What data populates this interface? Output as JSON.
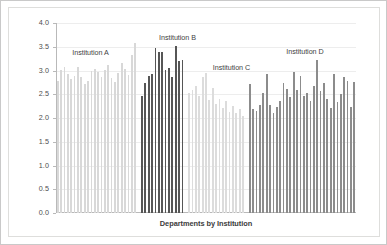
{
  "chart_data": {
    "type": "bar",
    "title": "",
    "xlabel": "Departments by Institution",
    "ylabel": "Mean Instructor-Student Interaction (PIPS)",
    "ylim": [
      0.0,
      4.0
    ],
    "ytick_labels": [
      "0.0",
      "0.5",
      "1.0",
      "1.5",
      "2.0",
      "2.5",
      "3.0",
      "3.5",
      "4.0"
    ],
    "ytick_values": [
      0.0,
      0.5,
      1.0,
      1.5,
      2.0,
      2.5,
      3.0,
      3.5,
      4.0
    ],
    "xtick_labels": [],
    "grid": true,
    "legend": "none",
    "annotations": [
      {
        "text": "Institution A",
        "x_frac": 0.115,
        "y_value": 3.47
      },
      {
        "text": "Institution B",
        "x_frac": 0.405,
        "y_value": 3.78
      },
      {
        "text": "Institution C",
        "x_frac": 0.585,
        "y_value": 3.15
      },
      {
        "text": "Institution D",
        "x_frac": 0.83,
        "y_value": 3.49
      }
    ],
    "series": [
      {
        "name": "Institution A",
        "color": "#d8d8d8",
        "values": [
          2.78,
          3.02,
          3.08,
          2.92,
          2.82,
          2.88,
          3.08,
          2.86,
          2.72,
          2.78,
          2.98,
          3.04,
          2.96,
          2.86,
          3.02,
          3.12,
          2.84,
          2.76,
          2.94,
          3.16,
          3.04,
          2.9,
          3.32,
          3.58
        ]
      },
      {
        "name": "Institution B",
        "color": "#565656",
        "values": [
          2.47,
          2.74,
          2.89,
          2.92,
          3.47,
          3.4,
          3.38,
          3.02,
          3.06,
          2.86,
          3.51,
          3.2,
          3.22
        ]
      },
      {
        "name": "Institution C",
        "color": "#dcdcdc",
        "values": [
          2.52,
          2.6,
          2.68,
          2.46,
          2.86,
          2.94,
          2.38,
          2.64,
          2.3,
          2.4,
          2.22,
          2.36,
          2.12,
          2.26,
          2.1,
          2.18,
          2.05
        ]
      },
      {
        "name": "Institution D",
        "color": "#8c8c8c",
        "values": [
          2.72,
          2.18,
          2.14,
          2.28,
          2.52,
          2.92,
          2.28,
          2.1,
          2.24,
          2.36,
          2.74,
          2.62,
          2.44,
          2.96,
          2.58,
          2.88,
          2.46,
          2.52,
          2.36,
          2.68,
          3.23,
          2.56,
          2.74,
          2.4,
          2.21,
          2.92,
          2.33,
          2.51,
          2.86,
          2.78,
          2.24,
          2.76
        ]
      }
    ]
  }
}
